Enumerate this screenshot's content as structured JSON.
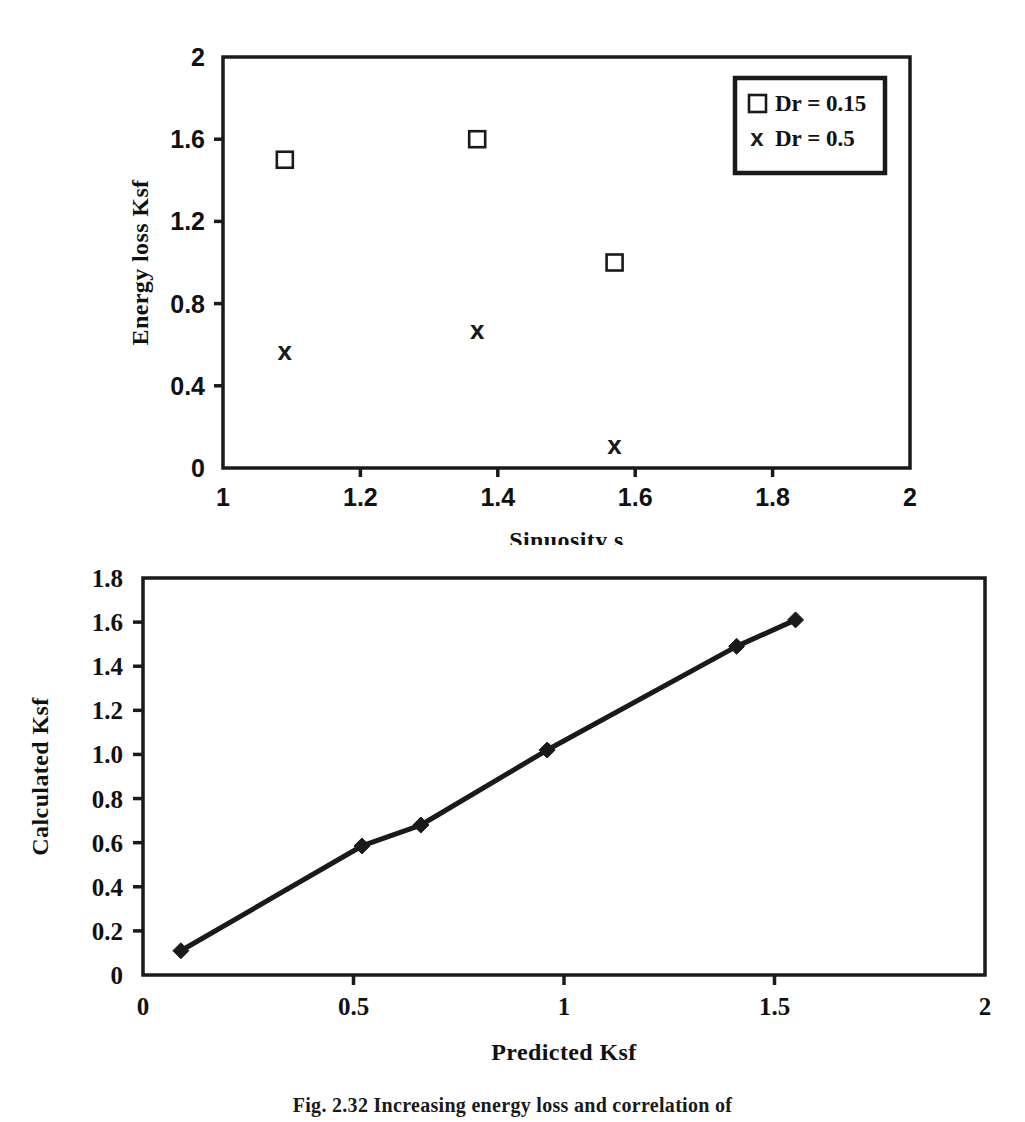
{
  "figure": {
    "caption": "Fig. 2.32   Increasing energy loss and correlation of"
  },
  "chart_data": [
    {
      "id": "top",
      "type": "scatter",
      "title": "",
      "xlabel": "Sinuosity s",
      "ylabel": "Energy loss Ksf",
      "xlim": [
        1,
        2
      ],
      "ylim": [
        0,
        2
      ],
      "xticks": [
        "1",
        "1.2",
        "1.4",
        "1.6",
        "1.8",
        "2"
      ],
      "xtick_values": [
        1,
        1.2,
        1.4,
        1.6,
        1.8,
        2
      ],
      "yticks": [
        "0",
        "0.4",
        "0.8",
        "1.2",
        "1.6",
        "2"
      ],
      "ytick_values": [
        0,
        0.4,
        0.8,
        1.2,
        1.6,
        2
      ],
      "grid": false,
      "legend_position": "top-right",
      "series": [
        {
          "name": "Dr = 0.15",
          "marker": "open-square",
          "x": [
            1.09,
            1.37,
            1.57
          ],
          "y": [
            1.5,
            1.6,
            1.0
          ]
        },
        {
          "name": "Dr = 0.5",
          "marker": "x-cross",
          "x": [
            1.09,
            1.37,
            1.57
          ],
          "y": [
            0.57,
            0.67,
            0.11
          ]
        }
      ]
    },
    {
      "id": "bottom",
      "type": "line",
      "title": "",
      "xlabel": "Predicted Ksf",
      "ylabel": "Calculated Ksf",
      "xlim": [
        0,
        2
      ],
      "ylim": [
        0,
        1.8
      ],
      "xticks": [
        "0",
        "0.5",
        "1",
        "1.5",
        "2"
      ],
      "xtick_values": [
        0,
        0.5,
        1,
        1.5,
        2
      ],
      "yticks": [
        "0",
        "0.2",
        "0.4",
        "0.6",
        "0.8",
        "1.0",
        "1.2",
        "1.4",
        "1.6",
        "1.8"
      ],
      "ytick_values": [
        0,
        0.2,
        0.4,
        0.6,
        0.8,
        1.0,
        1.2,
        1.4,
        1.6,
        1.8
      ],
      "grid": false,
      "legend_position": "none",
      "series": [
        {
          "name": "",
          "marker": "filled-diamond",
          "x": [
            0.09,
            0.52,
            0.66,
            0.96,
            1.41,
            1.55
          ],
          "y": [
            0.11,
            0.585,
            0.68,
            1.02,
            1.49,
            1.61
          ]
        }
      ]
    }
  ],
  "colors": {
    "axis": "#1a1a1a",
    "marker": "#1a1a1a",
    "line": "#1a1a1a",
    "background": "#ffffff"
  }
}
